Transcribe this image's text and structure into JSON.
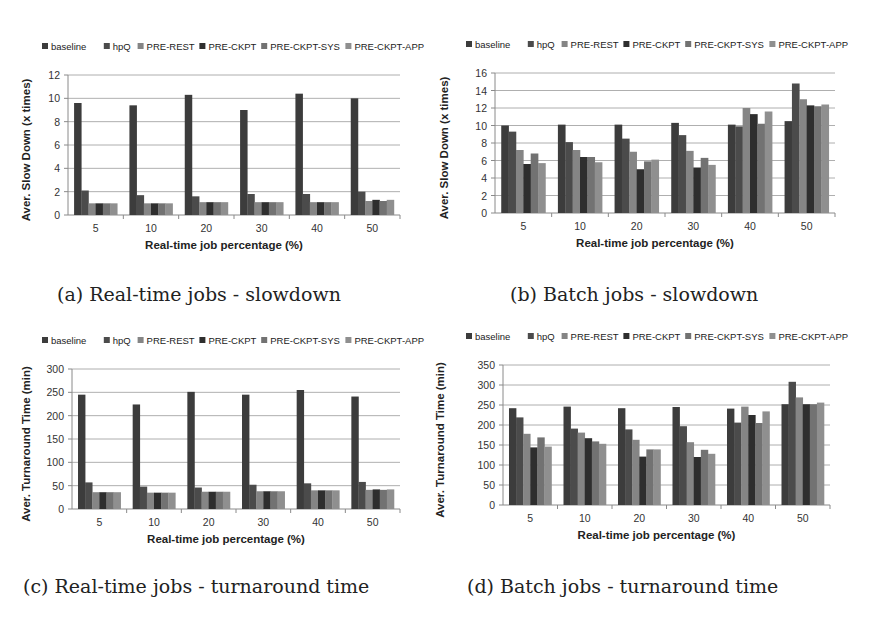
{
  "figure": {
    "captions": [
      "(a) Real-time jobs - slowdown",
      "(b) Batch jobs - slowdown",
      "(c) Real-time jobs - turnaround time",
      "(d) Batch jobs - turnaround time"
    ]
  },
  "series_colors": {
    "baseline": "#3c3c3c",
    "hpQ": "#4b4b4b",
    "PRE-REST": "#858585",
    "PRE-CKPT": "#2e2e2e",
    "PRE-CKPT-SYS": "#727272",
    "PRE-CKPT-APP": "#8f8f8f"
  },
  "chart_data": [
    {
      "id": "a",
      "type": "bar",
      "title": "(a) Real-time jobs - slowdown",
      "xlabel": "Real-time job percentage (%)",
      "ylabel": "Aver. Slow Down (x times)",
      "ylim": [
        0,
        12
      ],
      "yticks": [
        0,
        2,
        4,
        6,
        8,
        10,
        12
      ],
      "grid": true,
      "legend": "top",
      "categories": [
        "5",
        "10",
        "20",
        "30",
        "40",
        "50"
      ],
      "series": [
        {
          "name": "baseline",
          "values": [
            9.6,
            9.4,
            10.3,
            9.0,
            10.4,
            10.0
          ]
        },
        {
          "name": "hpQ",
          "values": [
            2.1,
            1.7,
            1.6,
            1.8,
            1.8,
            2.0
          ]
        },
        {
          "name": "PRE-REST",
          "values": [
            1.0,
            1.0,
            1.1,
            1.1,
            1.1,
            1.2
          ]
        },
        {
          "name": "PRE-CKPT",
          "values": [
            1.0,
            1.0,
            1.1,
            1.1,
            1.1,
            1.3
          ]
        },
        {
          "name": "PRE-CKPT-SYS",
          "values": [
            1.0,
            1.0,
            1.1,
            1.1,
            1.1,
            1.2
          ]
        },
        {
          "name": "PRE-CKPT-APP",
          "values": [
            1.0,
            1.0,
            1.1,
            1.1,
            1.1,
            1.3
          ]
        }
      ]
    },
    {
      "id": "b",
      "type": "bar",
      "title": "(b) Batch jobs - slowdown",
      "xlabel": "Real-time job percentage (%)",
      "ylabel": "Aver. Slow Down (x times)",
      "ylim": [
        0,
        16
      ],
      "yticks": [
        0,
        2,
        4,
        6,
        8,
        10,
        12,
        14,
        16
      ],
      "grid": true,
      "legend": "top",
      "categories": [
        "5",
        "10",
        "20",
        "30",
        "40",
        "50"
      ],
      "series": [
        {
          "name": "baseline",
          "values": [
            10.0,
            10.1,
            10.1,
            10.3,
            10.1,
            10.5
          ]
        },
        {
          "name": "hpQ",
          "values": [
            9.3,
            8.1,
            8.5,
            8.9,
            9.9,
            14.8
          ]
        },
        {
          "name": "PRE-REST",
          "values": [
            7.2,
            7.2,
            7.0,
            7.1,
            12.0,
            13.0
          ]
        },
        {
          "name": "PRE-CKPT",
          "values": [
            5.6,
            6.4,
            5.0,
            5.2,
            11.3,
            12.3
          ]
        },
        {
          "name": "PRE-CKPT-SYS",
          "values": [
            6.8,
            6.4,
            5.9,
            6.3,
            10.2,
            12.2
          ]
        },
        {
          "name": "PRE-CKPT-APP",
          "values": [
            5.7,
            5.8,
            6.1,
            5.5,
            11.6,
            12.4
          ]
        }
      ]
    },
    {
      "id": "c",
      "type": "bar",
      "title": "(c) Real-time jobs - turnaround time",
      "xlabel": "Real-time job percentage (%)",
      "ylabel": "Aver. Turnaround Time (min)",
      "ylim": [
        0,
        300
      ],
      "yticks": [
        0,
        50,
        100,
        150,
        200,
        250,
        300
      ],
      "grid": true,
      "legend": "top",
      "categories": [
        "5",
        "10",
        "20",
        "30",
        "40",
        "50"
      ],
      "series": [
        {
          "name": "baseline",
          "values": [
            245,
            224,
            251,
            245,
            255,
            241
          ]
        },
        {
          "name": "hpQ",
          "values": [
            57,
            48,
            46,
            52,
            55,
            58
          ]
        },
        {
          "name": "PRE-REST",
          "values": [
            36,
            35,
            37,
            38,
            40,
            41
          ]
        },
        {
          "name": "PRE-CKPT",
          "values": [
            36,
            35,
            37,
            38,
            40,
            42
          ]
        },
        {
          "name": "PRE-CKPT-SYS",
          "values": [
            36,
            35,
            37,
            38,
            40,
            41
          ]
        },
        {
          "name": "PRE-CKPT-APP",
          "values": [
            36,
            35,
            37,
            38,
            40,
            42
          ]
        }
      ]
    },
    {
      "id": "d",
      "type": "bar",
      "title": "(d) Batch jobs - turnaround time",
      "xlabel": "Real-time job percentage (%)",
      "ylabel": "Aver. Turnaround Time (min)",
      "ylim": [
        0,
        350
      ],
      "yticks": [
        0,
        50,
        100,
        150,
        200,
        250,
        300,
        350
      ],
      "grid": true,
      "legend": "top",
      "categories": [
        "5",
        "10",
        "20",
        "30",
        "40",
        "50"
      ],
      "series": [
        {
          "name": "baseline",
          "values": [
            242,
            246,
            242,
            245,
            241,
            252
          ]
        },
        {
          "name": "hpQ",
          "values": [
            219,
            191,
            189,
            197,
            206,
            308
          ]
        },
        {
          "name": "PRE-REST",
          "values": [
            178,
            181,
            163,
            157,
            246,
            269
          ]
        },
        {
          "name": "PRE-CKPT",
          "values": [
            144,
            167,
            121,
            120,
            225,
            252
          ]
        },
        {
          "name": "PRE-CKPT-SYS",
          "values": [
            169,
            159,
            139,
            138,
            205,
            252
          ]
        },
        {
          "name": "PRE-CKPT-APP",
          "values": [
            146,
            153,
            139,
            128,
            234,
            256
          ]
        }
      ]
    }
  ]
}
